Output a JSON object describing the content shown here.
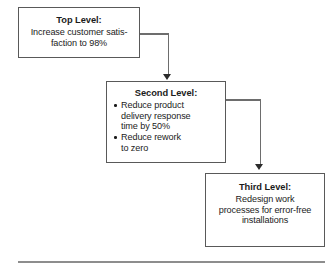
{
  "diagram": {
    "type": "cascading-goals-flowchart",
    "boxes": [
      {
        "id": "top",
        "name": "top-level-box",
        "title": "Top Level:",
        "lines": [
          "Increase customer satis-",
          "faction to 98%"
        ]
      },
      {
        "id": "second",
        "name": "second-level-box",
        "title": "Second Level:",
        "bullets": [
          [
            "Reduce product",
            "delivery response",
            "time by 50%"
          ],
          [
            "Reduce rework",
            "to zero"
          ]
        ]
      },
      {
        "id": "third",
        "name": "third-level-box",
        "title": "Third Level:",
        "lines": [
          "Redesign work",
          "processes for error-free",
          "installations"
        ]
      }
    ],
    "connectors": [
      {
        "from": "top",
        "to": "second",
        "style": "elbow-right-down",
        "arrow": "down"
      },
      {
        "from": "second",
        "to": "third",
        "style": "elbow-right-down",
        "arrow": "down"
      }
    ],
    "colors": {
      "box_border": "#595959",
      "connector": "#6d6d6d",
      "arrowhead": "#2b2b2b",
      "rule": "#8d8d8d",
      "text": "#1b1b1b",
      "background": "#ffffff"
    }
  }
}
